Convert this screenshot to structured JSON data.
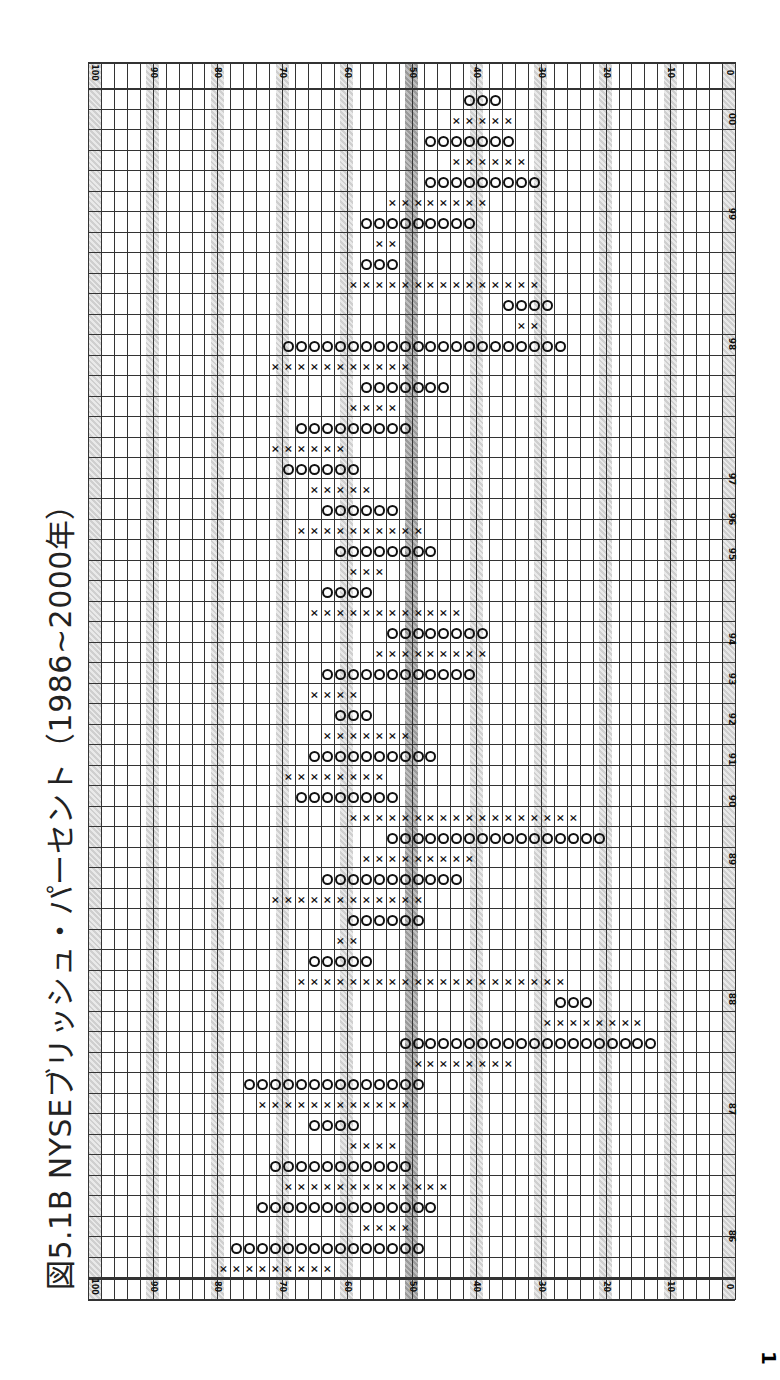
{
  "title": "図5.1B NYSEブリッシュ・パーセント（1986~2000年）",
  "chart_data": {
    "type": "point-and-figure",
    "title": "図5.1B NYSEブリッシュ・パーセント（1986~2000年）",
    "xlabel": "",
    "ylabel": "Bullish Percent (%)",
    "orientation": "rotated 90° (value axis horizontal, 100 left → 0 right; time runs bottom → top)",
    "box_size": 2,
    "ylim": [
      0,
      100
    ],
    "value_ticks": [
      100,
      90,
      80,
      70,
      60,
      50,
      40,
      30,
      20,
      10,
      0
    ],
    "shaded_levels": [
      90,
      80,
      70,
      60,
      50,
      40,
      30,
      20,
      10,
      0
    ],
    "highlighted_level": 50,
    "year_labels": [
      "86",
      "87",
      "88",
      "89",
      "90",
      "91",
      "92",
      "93",
      "94",
      "95",
      "96",
      "97",
      "98",
      "99",
      "00"
    ],
    "columns": [
      {
        "type": "X",
        "from": 62,
        "to": 80
      },
      {
        "type": "O",
        "from": 48,
        "to": 78
      },
      {
        "type": "X",
        "from": 50,
        "to": 58
      },
      {
        "type": "O",
        "from": 46,
        "to": 74
      },
      {
        "type": "X",
        "from": 44,
        "to": 70
      },
      {
        "type": "O",
        "from": 50,
        "to": 72
      },
      {
        "type": "X",
        "from": 52,
        "to": 60
      },
      {
        "type": "O",
        "from": 58,
        "to": 66
      },
      {
        "type": "X",
        "from": 50,
        "to": 74
      },
      {
        "type": "O",
        "from": 48,
        "to": 76
      },
      {
        "type": "X",
        "from": 34,
        "to": 50
      },
      {
        "type": "O",
        "from": 12,
        "to": 52
      },
      {
        "type": "X",
        "from": 14,
        "to": 30
      },
      {
        "type": "O",
        "from": 22,
        "to": 28
      },
      {
        "type": "X",
        "from": 26,
        "to": 68
      },
      {
        "type": "O",
        "from": 56,
        "to": 66
      },
      {
        "type": "X",
        "from": 58,
        "to": 62
      },
      {
        "type": "O",
        "from": 48,
        "to": 60
      },
      {
        "type": "X",
        "from": 48,
        "to": 72
      },
      {
        "type": "O",
        "from": 42,
        "to": 64
      },
      {
        "type": "X",
        "from": 40,
        "to": 58
      },
      {
        "type": "O",
        "from": 20,
        "to": 54
      },
      {
        "type": "X",
        "from": 24,
        "to": 60
      },
      {
        "type": "O",
        "from": 52,
        "to": 68
      },
      {
        "type": "X",
        "from": 54,
        "to": 70
      },
      {
        "type": "O",
        "from": 46,
        "to": 66
      },
      {
        "type": "X",
        "from": 50,
        "to": 64
      },
      {
        "type": "O",
        "from": 56,
        "to": 62
      },
      {
        "type": "X",
        "from": 58,
        "to": 66
      },
      {
        "type": "O",
        "from": 40,
        "to": 64
      },
      {
        "type": "X",
        "from": 38,
        "to": 56
      },
      {
        "type": "O",
        "from": 38,
        "to": 54
      },
      {
        "type": "X",
        "from": 42,
        "to": 66
      },
      {
        "type": "O",
        "from": 56,
        "to": 64
      },
      {
        "type": "X",
        "from": 54,
        "to": 60
      },
      {
        "type": "O",
        "from": 46,
        "to": 62
      },
      {
        "type": "X",
        "from": 48,
        "to": 68
      },
      {
        "type": "O",
        "from": 52,
        "to": 64
      },
      {
        "type": "X",
        "from": 56,
        "to": 66
      },
      {
        "type": "O",
        "from": 58,
        "to": 70
      },
      {
        "type": "X",
        "from": 60,
        "to": 72
      },
      {
        "type": "O",
        "from": 50,
        "to": 68
      },
      {
        "type": "X",
        "from": 52,
        "to": 60
      },
      {
        "type": "O",
        "from": 44,
        "to": 58
      },
      {
        "type": "X",
        "from": 50,
        "to": 72
      },
      {
        "type": "O",
        "from": 26,
        "to": 70
      },
      {
        "type": "X",
        "from": 30,
        "to": 34
      },
      {
        "type": "O",
        "from": 28,
        "to": 36
      },
      {
        "type": "X",
        "from": 30,
        "to": 60
      },
      {
        "type": "O",
        "from": 52,
        "to": 58
      },
      {
        "type": "X",
        "from": 52,
        "to": 56
      },
      {
        "type": "O",
        "from": 40,
        "to": 58
      },
      {
        "type": "X",
        "from": 38,
        "to": 54
      },
      {
        "type": "O",
        "from": 30,
        "to": 48
      },
      {
        "type": "X",
        "from": 32,
        "to": 44
      },
      {
        "type": "O",
        "from": 34,
        "to": 48
      },
      {
        "type": "X",
        "from": 34,
        "to": 44
      },
      {
        "type": "O",
        "from": 36,
        "to": 42
      }
    ]
  }
}
